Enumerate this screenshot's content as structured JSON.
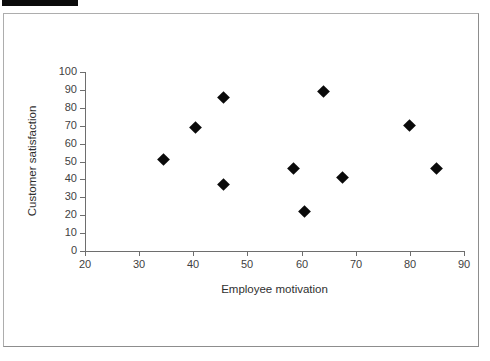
{
  "top_strip": {
    "selection_block_visible": true,
    "ghost_text_left": "",
    "ghost_text_mid": "",
    "ghost_text_right": ""
  },
  "figure": {
    "border_color": "#9a9a9a",
    "background": "#ffffff"
  },
  "chart_data": {
    "type": "scatter",
    "title": "",
    "xlabel": "Employee motivation",
    "ylabel": "Customer satisfaction",
    "xlim": [
      20,
      90
    ],
    "ylim": [
      0,
      100
    ],
    "xticks": [
      20,
      30,
      40,
      50,
      60,
      70,
      80,
      90
    ],
    "yticks": [
      0,
      10,
      20,
      30,
      40,
      50,
      60,
      70,
      80,
      90,
      100
    ],
    "grid": false,
    "legend": null,
    "marker": "diamond",
    "marker_color": "#0a0a0a",
    "series": [
      {
        "name": "Observations",
        "points": [
          {
            "x": 34.5,
            "y": 51
          },
          {
            "x": 40.5,
            "y": 69
          },
          {
            "x": 45.5,
            "y": 86
          },
          {
            "x": 45.5,
            "y": 37
          },
          {
            "x": 58.5,
            "y": 46
          },
          {
            "x": 60.5,
            "y": 22
          },
          {
            "x": 64.0,
            "y": 89
          },
          {
            "x": 67.5,
            "y": 41
          },
          {
            "x": 80.0,
            "y": 70
          },
          {
            "x": 85.0,
            "y": 46
          }
        ]
      }
    ]
  }
}
